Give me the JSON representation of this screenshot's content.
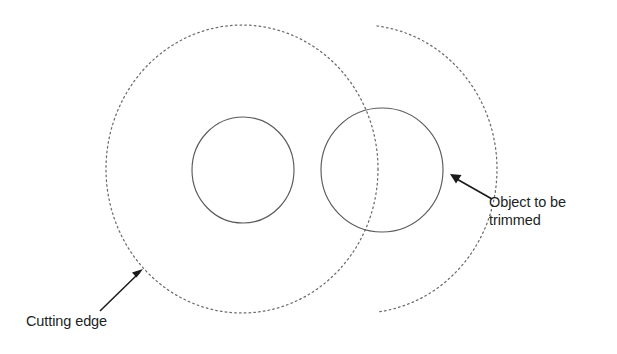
{
  "canvas": {
    "width": 617,
    "height": 354,
    "background": "#ffffff"
  },
  "colors": {
    "stroke_solid": "#5a5a5a",
    "stroke_dotted": "#6b6b70",
    "arrow": "#1a1a1a",
    "text": "#211f1f"
  },
  "labels": {
    "cutting_edge": "Cutting edge",
    "object_trimmed_line1": "Object to be",
    "object_trimmed_line2": "trimmed"
  },
  "shapes": {
    "cutting_edge_circle": {
      "name": "cutting-edge-circle",
      "style": "dotted",
      "cx": 242,
      "cy": 169,
      "rx": 136,
      "ry": 144
    },
    "inner_circle": {
      "name": "inner-circle",
      "style": "solid",
      "cx": 243,
      "cy": 170,
      "rx": 51,
      "ry": 53
    },
    "object_circle": {
      "name": "object-circle",
      "style": "solid",
      "cx": 382,
      "cy": 170,
      "rx": 61,
      "ry": 62
    }
  },
  "leaders": {
    "cutting_edge_arrow": {
      "name": "cutting-edge-leader",
      "tail_x": 100,
      "tail_y": 311,
      "tip_x": 142,
      "tip_y": 270
    },
    "object_trimmed_arrow": {
      "name": "object-trimmed-leader",
      "tail_x": 492,
      "tail_y": 199,
      "tip_x": 451,
      "tip_y": 175
    }
  }
}
